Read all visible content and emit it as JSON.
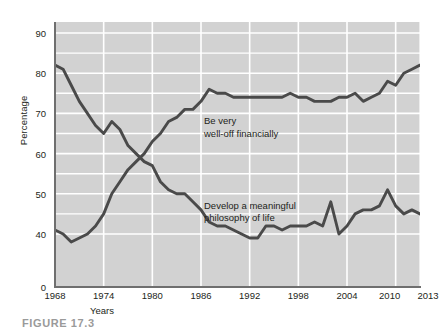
{
  "figure": {
    "caption": "FIGURE 17.3"
  },
  "chart_data": {
    "type": "line",
    "title": "",
    "xlabel": "Years",
    "ylabel": "Percentage",
    "xlim": [
      1968,
      2013
    ],
    "ylim": [
      35,
      93
    ],
    "grid": true,
    "grid_color": "#ffffff",
    "plot_background": "#d2d2d2",
    "line_color": "#4a4a4a",
    "legend_position": "inline-annotations",
    "xticks": [
      "1968",
      "1974",
      "1980",
      "1986",
      "1992",
      "1998",
      "2004",
      "2010",
      "2013"
    ],
    "xtick_values": [
      1968,
      1974,
      1980,
      1986,
      1992,
      1998,
      2004,
      2010,
      2013
    ],
    "yticks": [
      "0",
      "40",
      "50",
      "60",
      "70",
      "80",
      "90"
    ],
    "ytick_values": [
      0,
      40,
      50,
      60,
      70,
      80,
      90
    ],
    "y_axis_broken": true,
    "y_axis_break_note": "Axis compressed between 0 and 40",
    "annotations": [
      {
        "text": "Be very\nwell-off financially",
        "x": 1986,
        "y": 68,
        "series": "Be very well-off financially"
      },
      {
        "text": "Develop a meaningful\nphilosophy of life",
        "x": 1986,
        "y": 47,
        "series": "Develop a meaningful philosophy of life"
      }
    ],
    "x": [
      1968,
      1969,
      1970,
      1971,
      1972,
      1973,
      1974,
      1975,
      1976,
      1977,
      1978,
      1979,
      1980,
      1981,
      1982,
      1983,
      1984,
      1985,
      1986,
      1987,
      1988,
      1989,
      1990,
      1991,
      1992,
      1993,
      1994,
      1995,
      1996,
      1997,
      1998,
      1999,
      2000,
      2001,
      2002,
      2003,
      2004,
      2005,
      2006,
      2007,
      2008,
      2009,
      2010,
      2011,
      2012,
      2013
    ],
    "series": [
      {
        "name": "Develop a meaningful philosophy of life",
        "values": [
          82,
          81,
          77,
          73,
          70,
          67,
          65,
          68,
          66,
          62,
          60,
          58,
          57,
          53,
          51,
          50,
          50,
          48,
          46,
          43,
          42,
          42,
          41,
          40,
          39,
          39,
          42,
          42,
          41,
          42,
          42,
          42,
          43,
          42,
          48,
          40,
          42,
          45,
          46,
          46,
          47,
          51,
          47,
          45,
          46,
          45
        ]
      },
      {
        "name": "Be very well-off financially",
        "values": [
          41,
          40,
          38,
          39,
          40,
          42,
          45,
          50,
          53,
          56,
          58,
          60,
          63,
          65,
          68,
          69,
          71,
          71,
          73,
          76,
          75,
          75,
          74,
          74,
          74,
          74,
          74,
          74,
          74,
          75,
          74,
          74,
          73,
          73,
          73,
          74,
          74,
          75,
          73,
          74,
          75,
          78,
          77,
          80,
          81,
          82
        ]
      }
    ]
  }
}
